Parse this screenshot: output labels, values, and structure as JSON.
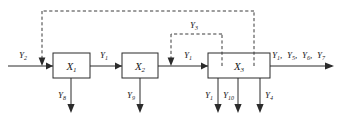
{
  "diagram": {
    "type": "block-flow-diagram",
    "title": "",
    "blocks": [
      {
        "id": "x1",
        "label": "X",
        "subscript": "1"
      },
      {
        "id": "x2",
        "label": "X",
        "subscript": "2"
      },
      {
        "id": "x3",
        "label": "X",
        "subscript": "3"
      }
    ],
    "signals": {
      "input_left": {
        "base": "Y",
        "sub": "2"
      },
      "between_x1_x2": {
        "base": "Y",
        "sub": "1"
      },
      "between_x2_x3": {
        "base": "Y",
        "sub": "1"
      },
      "output_right": {
        "text": "Y₁, Y₅, Y₆, Y₇"
      },
      "feedback_inner": {
        "base": "Y",
        "sub": "3"
      },
      "down_x1": {
        "base": "Y",
        "sub": "8"
      },
      "down_x2": {
        "base": "Y",
        "sub": "9"
      },
      "down_x3_a": {
        "base": "Y",
        "sub": "1"
      },
      "down_x3_b": {
        "base": "Y",
        "sub": "10"
      },
      "down_x3_c": {
        "base": "Y",
        "sub": "4"
      }
    },
    "output_parts": [
      {
        "base": "Y",
        "sub": "1",
        "sep": ","
      },
      {
        "base": "Y",
        "sub": "5",
        "sep": ","
      },
      {
        "base": "Y",
        "sub": "6",
        "sep": ","
      },
      {
        "base": "Y",
        "sub": "7",
        "sep": ""
      }
    ],
    "colors": {
      "line": "#2b2b2b",
      "dashed": "#3a3a3a",
      "text": "#1a1a1a",
      "background": "#ffffff"
    }
  }
}
